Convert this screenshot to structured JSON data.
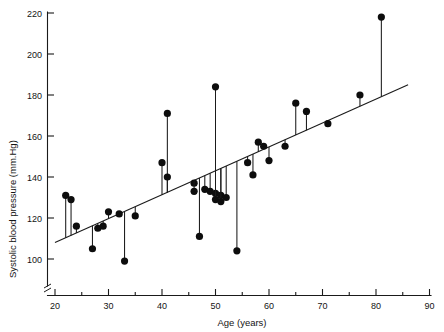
{
  "chart_data": {
    "type": "scatter",
    "title": "",
    "xlabel": "Age (years)",
    "ylabel": "Systolic blood pressure (mm.Hg)",
    "xlim": [
      20,
      90
    ],
    "ylim": [
      100,
      220
    ],
    "xticks": [
      20,
      30,
      40,
      50,
      60,
      70,
      80,
      90
    ],
    "xtick_labels": [
      "20",
      "30",
      "40",
      "50",
      "60",
      "70",
      "80",
      "90"
    ],
    "yticks": [
      100,
      120,
      140,
      160,
      180,
      200,
      220
    ],
    "ytick_labels": [
      "100",
      "120",
      "140",
      "160",
      "180",
      "200",
      "220"
    ],
    "x_minor_step": 5,
    "grid": false,
    "legend": null,
    "axis_break": {
      "axis": "y",
      "note": "zig-zag break below 100 on y-axis near origin"
    },
    "marker": "filled-circle",
    "stems": "vertical drop lines from each point to the regression line",
    "series": [
      {
        "name": "Patients",
        "x": [
          22,
          23,
          24,
          27,
          28,
          29,
          30,
          32,
          33,
          35,
          40,
          41,
          41,
          46,
          46,
          47,
          48,
          49,
          50,
          50,
          50,
          51,
          51,
          52,
          54,
          56,
          57,
          58,
          59,
          60,
          63,
          65,
          67,
          71,
          77,
          81
        ],
        "y": [
          131,
          129,
          116,
          105,
          115,
          116,
          123,
          122,
          99,
          121,
          147,
          171,
          140,
          137,
          133,
          111,
          134,
          133,
          132,
          184,
          129,
          131,
          128,
          130,
          104,
          147,
          141,
          157,
          155,
          148,
          155,
          176,
          172,
          166,
          180,
          218
        ]
      }
    ],
    "regression_line": {
      "x_start": 20,
      "y_start": 108,
      "x_end": 86,
      "y_end": 185
    }
  },
  "axes": {
    "x_axis_label": "Age (years)",
    "y_axis_label": "Systolic blood pressure (mm.Hg)"
  }
}
